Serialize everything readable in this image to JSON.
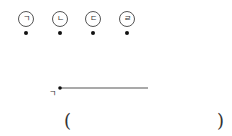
{
  "options": [
    {
      "label": "ㄱ",
      "x": 18
    },
    {
      "label": "ㄴ",
      "x": 52
    },
    {
      "label": "ㄷ",
      "x": 85
    },
    {
      "label": "ㄹ",
      "x": 119
    }
  ],
  "figure": {
    "point_label": "ㄱ",
    "line": {
      "x1": 60,
      "y1": 88,
      "x2": 148,
      "y2": 88
    },
    "line_color": "#555555"
  },
  "answer": {
    "open_paren": "(",
    "close_paren": ")",
    "value": ""
  }
}
